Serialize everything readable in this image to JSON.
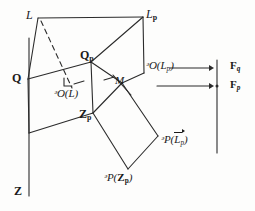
{
  "figure": {
    "stroke_color": "#2b2b2b",
    "background_color": "#fdfdfc",
    "labels": {
      "L": "L",
      "Lp": "L",
      "Lp_sub": "p",
      "Q": "Q",
      "Qp": "Q",
      "Qp_sub": "p",
      "Z": "Z",
      "Zp": "Z",
      "Zp_sub": "p",
      "M": "M",
      "O_L": "ᵊO(L)",
      "O_Lp": "ᵊO(L",
      "O_Lp_sub": "p",
      "O_Lp_tail": ")",
      "P_Lp_head": "ᵊP(",
      "P_Lp_inner": "L",
      "P_Lp_inner_sub": "p",
      "P_Lp_tail": ")",
      "P_Zp_head": "ᵊP(",
      "P_Zp_inner": "Z",
      "P_Zp_inner_sub": "p",
      "P_Zp_tail": ")",
      "Fq": "F",
      "Fq_sub": "q",
      "Fp": "F",
      "Fp_sub": "p"
    },
    "label_text": {
      "L": "L",
      "Lp": "L_p",
      "Q": "Q",
      "Qp": "Q_p",
      "Z": "Z",
      "Zp": "Z_p",
      "M": "M",
      "O_L": "O(L)",
      "O_Lp": "O(L_p)",
      "P_Lp": "P(L_p)",
      "P_Zp": "P(Z_p)",
      "Fq": "F_q",
      "Fp": "F_p"
    },
    "vertices": {
      "L": [
        38,
        18
      ],
      "Lp": [
        143,
        17
      ],
      "Q": [
        28,
        79
      ],
      "Qp": [
        91,
        62
      ],
      "Zp": [
        93,
        113
      ],
      "Z_axis_top": [
        29,
        40
      ],
      "Z_axis_bottom": [
        29,
        196
      ],
      "quad_bottom_left": [
        29,
        133
      ],
      "O_Lp_corner": [
        144,
        73
      ],
      "M": [
        122,
        83
      ],
      "diamond_right": [
        158,
        136
      ],
      "diamond_bottom": [
        128,
        169
      ],
      "dash_end": [
        72,
        88
      ]
    },
    "arrows": {
      "upper": {
        "x1": 170,
        "y1": 68,
        "x2": 212,
        "y2": 68
      },
      "lower": {
        "x1": 157,
        "y1": 86,
        "x2": 212,
        "y2": 86
      }
    },
    "vertical_bar": {
      "x": 216,
      "y1": 60,
      "y2": 153,
      "tick_y": 86
    }
  }
}
